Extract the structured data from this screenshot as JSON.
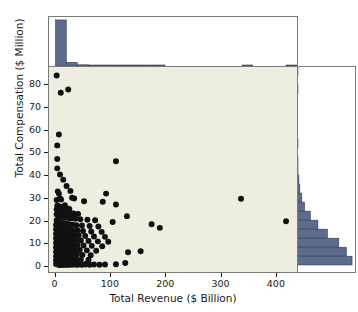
{
  "chart_data": {
    "type": "scatter",
    "title": "",
    "subtitle": "",
    "xlabel": "Total Revenue ($ Billion)",
    "ylabel": "Total Compensation ($ Million)",
    "xlim": [
      -12,
      440
    ],
    "ylim": [
      -3,
      88
    ],
    "xticks": [
      0,
      100,
      200,
      300,
      400
    ],
    "yticks": [
      0,
      10,
      20,
      30,
      40,
      50,
      60,
      70,
      80
    ],
    "grid": false,
    "legend": null,
    "marker": {
      "shape": "circle",
      "color": "#111111",
      "size": 3.0
    },
    "panel_background": "#eeeee0",
    "histogram_color": "#5d6c8c",
    "histogram_edge_color": "#2f3a52",
    "axis_color": "#7a7a7a",
    "points": [
      [
        2,
        84.2
      ],
      [
        9.5,
        76.6
      ],
      [
        23,
        78.0
      ],
      [
        6,
        58.0
      ],
      [
        3,
        53.2
      ],
      [
        3,
        47.2
      ],
      [
        3,
        43.0
      ],
      [
        110,
        46.2
      ],
      [
        8,
        40.3
      ],
      [
        14,
        38.0
      ],
      [
        20,
        35.2
      ],
      [
        27,
        33.0
      ],
      [
        4,
        32.8
      ],
      [
        6,
        31.8
      ],
      [
        92,
        31.8
      ],
      [
        30,
        30.0
      ],
      [
        34,
        29.6
      ],
      [
        338,
        29.5
      ],
      [
        8,
        29.6
      ],
      [
        10,
        29.2
      ],
      [
        2,
        29.0
      ],
      [
        52,
        28.4
      ],
      [
        86,
        28.2
      ],
      [
        110,
        27.0
      ],
      [
        17,
        26.6
      ],
      [
        3,
        26.4
      ],
      [
        5,
        26.2
      ],
      [
        9,
        26.0
      ],
      [
        12,
        25.8
      ],
      [
        16,
        25.4
      ],
      [
        21,
        25.2
      ],
      [
        25,
        25.0
      ],
      [
        2,
        24.8
      ],
      [
        4,
        24.6
      ],
      [
        6,
        24.4
      ],
      [
        8,
        24.2
      ],
      [
        11,
        24.0
      ],
      [
        14,
        23.8
      ],
      [
        18,
        23.6
      ],
      [
        22,
        23.4
      ],
      [
        27,
        23.2
      ],
      [
        33,
        23.0
      ],
      [
        41,
        22.8
      ],
      [
        2,
        22.6
      ],
      [
        3,
        22.4
      ],
      [
        5,
        22.2
      ],
      [
        7,
        22.0
      ],
      [
        9,
        21.8
      ],
      [
        12,
        21.6
      ],
      [
        15,
        21.4
      ],
      [
        19,
        21.2
      ],
      [
        24,
        21.0
      ],
      [
        29,
        20.8
      ],
      [
        36,
        20.6
      ],
      [
        45,
        20.4
      ],
      [
        58,
        20.2
      ],
      [
        72,
        20.0
      ],
      [
        130,
        21.8
      ],
      [
        104,
        19.2
      ],
      [
        2,
        20.0
      ],
      [
        3,
        19.8
      ],
      [
        4,
        19.6
      ],
      [
        6,
        19.4
      ],
      [
        8,
        19.2
      ],
      [
        10,
        19.0
      ],
      [
        13,
        18.8
      ],
      [
        16,
        18.6
      ],
      [
        20,
        18.4
      ],
      [
        25,
        18.2
      ],
      [
        31,
        18.0
      ],
      [
        38,
        17.8
      ],
      [
        48,
        17.6
      ],
      [
        62,
        17.4
      ],
      [
        78,
        17.2
      ],
      [
        190,
        16.6
      ],
      [
        175,
        18.2
      ],
      [
        420,
        19.5
      ],
      [
        1,
        18.0
      ],
      [
        2,
        17.8
      ],
      [
        3,
        17.6
      ],
      [
        4,
        17.4
      ],
      [
        6,
        17.2
      ],
      [
        7,
        17.0
      ],
      [
        9,
        16.8
      ],
      [
        11,
        16.6
      ],
      [
        14,
        16.4
      ],
      [
        17,
        16.2
      ],
      [
        21,
        16.0
      ],
      [
        26,
        15.8
      ],
      [
        32,
        15.6
      ],
      [
        40,
        15.4
      ],
      [
        50,
        15.2
      ],
      [
        65,
        15.0
      ],
      [
        84,
        14.8
      ],
      [
        1,
        16.0
      ],
      [
        2,
        15.8
      ],
      [
        3,
        15.6
      ],
      [
        4,
        15.4
      ],
      [
        5,
        15.2
      ],
      [
        7,
        15.0
      ],
      [
        8,
        14.8
      ],
      [
        10,
        14.6
      ],
      [
        12,
        14.4
      ],
      [
        15,
        14.2
      ],
      [
        18,
        14.0
      ],
      [
        22,
        13.8
      ],
      [
        27,
        13.6
      ],
      [
        34,
        13.4
      ],
      [
        42,
        13.2
      ],
      [
        54,
        13.0
      ],
      [
        70,
        12.8
      ],
      [
        90,
        12.6
      ],
      [
        1,
        14.0
      ],
      [
        2,
        13.8
      ],
      [
        3,
        13.6
      ],
      [
        4,
        13.4
      ],
      [
        5,
        13.2
      ],
      [
        6,
        13.0
      ],
      [
        8,
        12.8
      ],
      [
        9,
        12.6
      ],
      [
        11,
        12.4
      ],
      [
        13,
        12.2
      ],
      [
        16,
        12.0
      ],
      [
        20,
        11.8
      ],
      [
        24,
        11.6
      ],
      [
        30,
        11.4
      ],
      [
        37,
        11.2
      ],
      [
        46,
        11.0
      ],
      [
        60,
        10.8
      ],
      [
        77,
        10.6
      ],
      [
        96,
        10.4
      ],
      [
        1,
        12.0
      ],
      [
        2,
        11.8
      ],
      [
        3,
        11.6
      ],
      [
        4,
        11.4
      ],
      [
        5,
        11.2
      ],
      [
        6,
        11.0
      ],
      [
        7,
        10.8
      ],
      [
        9,
        10.6
      ],
      [
        10,
        10.4
      ],
      [
        12,
        10.2
      ],
      [
        14,
        10.0
      ],
      [
        17,
        9.8
      ],
      [
        21,
        9.6
      ],
      [
        26,
        9.4
      ],
      [
        32,
        9.2
      ],
      [
        40,
        9.0
      ],
      [
        51,
        8.8
      ],
      [
        66,
        8.6
      ],
      [
        85,
        8.4
      ],
      [
        1,
        10.0
      ],
      [
        2,
        9.8
      ],
      [
        3,
        9.6
      ],
      [
        4,
        9.4
      ],
      [
        5,
        9.2
      ],
      [
        6,
        9.0
      ],
      [
        7,
        8.8
      ],
      [
        8,
        8.6
      ],
      [
        10,
        8.4
      ],
      [
        11,
        8.2
      ],
      [
        13,
        8.0
      ],
      [
        15,
        7.8
      ],
      [
        18,
        7.6
      ],
      [
        22,
        7.4
      ],
      [
        28,
        7.2
      ],
      [
        35,
        7.0
      ],
      [
        44,
        6.8
      ],
      [
        57,
        6.6
      ],
      [
        74,
        6.4
      ],
      [
        1,
        8.0
      ],
      [
        2,
        7.8
      ],
      [
        3,
        7.6
      ],
      [
        4,
        7.4
      ],
      [
        5,
        7.2
      ],
      [
        6,
        7.0
      ],
      [
        7,
        6.8
      ],
      [
        8,
        6.6
      ],
      [
        9,
        6.4
      ],
      [
        11,
        6.2
      ],
      [
        12,
        6.0
      ],
      [
        14,
        5.8
      ],
      [
        17,
        5.6
      ],
      [
        20,
        5.4
      ],
      [
        25,
        5.2
      ],
      [
        31,
        5.0
      ],
      [
        39,
        4.8
      ],
      [
        49,
        4.6
      ],
      [
        64,
        4.4
      ],
      [
        155,
        6.2
      ],
      [
        132,
        5.8
      ],
      [
        1,
        6.0
      ],
      [
        2,
        5.8
      ],
      [
        3,
        5.6
      ],
      [
        4,
        5.4
      ],
      [
        5,
        5.2
      ],
      [
        6,
        5.0
      ],
      [
        7,
        4.8
      ],
      [
        8,
        4.6
      ],
      [
        9,
        4.4
      ],
      [
        10,
        4.2
      ],
      [
        12,
        4.0
      ],
      [
        13,
        3.8
      ],
      [
        16,
        3.6
      ],
      [
        19,
        3.4
      ],
      [
        23,
        3.2
      ],
      [
        29,
        3.0
      ],
      [
        36,
        2.8
      ],
      [
        46,
        2.6
      ],
      [
        60,
        2.4
      ],
      [
        1,
        4.0
      ],
      [
        2,
        3.8
      ],
      [
        3,
        3.6
      ],
      [
        4,
        3.4
      ],
      [
        5,
        3.2
      ],
      [
        6,
        3.0
      ],
      [
        7,
        2.8
      ],
      [
        8,
        2.6
      ],
      [
        9,
        2.4
      ],
      [
        10,
        2.2
      ],
      [
        11,
        2.0
      ],
      [
        13,
        1.8
      ],
      [
        15,
        1.6
      ],
      [
        18,
        1.4
      ],
      [
        22,
        1.2
      ],
      [
        27,
        1.0
      ],
      [
        34,
        0.9
      ],
      [
        43,
        0.8
      ],
      [
        56,
        0.7
      ],
      [
        1,
        2.2
      ],
      [
        2,
        2.0
      ],
      [
        3,
        1.8
      ],
      [
        4,
        1.6
      ],
      [
        5,
        1.4
      ],
      [
        6,
        1.2
      ],
      [
        7,
        1.0
      ],
      [
        8,
        0.9
      ],
      [
        9,
        0.8
      ],
      [
        10,
        0.7
      ],
      [
        12,
        0.6
      ],
      [
        14,
        0.5
      ],
      [
        17,
        0.5
      ],
      [
        21,
        0.4
      ],
      [
        26,
        0.4
      ],
      [
        33,
        0.4
      ],
      [
        42,
        0.3
      ],
      [
        54,
        0.3
      ],
      [
        70,
        0.3
      ],
      [
        90,
        0.3
      ],
      [
        110,
        0.4
      ],
      [
        127,
        1.0
      ],
      [
        1,
        0.6
      ],
      [
        2,
        0.5
      ],
      [
        3,
        0.4
      ],
      [
        4,
        0.4
      ],
      [
        5,
        0.3
      ],
      [
        6,
        0.3
      ],
      [
        7,
        0.3
      ],
      [
        8,
        0.2
      ],
      [
        9,
        0.2
      ],
      [
        11,
        0.2
      ],
      [
        13,
        0.2
      ],
      [
        16,
        0.2
      ],
      [
        20,
        0.2
      ],
      [
        24,
        0.2
      ],
      [
        30,
        0.2
      ],
      [
        38,
        0.2
      ],
      [
        48,
        0.2
      ],
      [
        62,
        0.2
      ],
      [
        80,
        0.2
      ]
    ]
  },
  "top_histogram": {
    "orientation": "vertical",
    "bin_width": 20,
    "bin_starts": [
      0,
      20,
      40,
      60,
      80,
      100,
      120,
      140,
      160,
      180,
      200,
      220,
      240,
      260,
      280,
      300,
      320,
      340,
      360,
      380,
      400,
      420
    ],
    "counts": [
      232,
      18,
      6,
      4,
      3,
      3,
      2,
      2,
      1,
      1,
      0,
      0,
      0,
      0,
      0,
      0,
      0,
      1,
      0,
      0,
      0,
      1
    ],
    "max_count": 232
  },
  "right_histogram": {
    "orientation": "horizontal",
    "bin_width": 4,
    "bin_starts": [
      0,
      4,
      8,
      12,
      16,
      20,
      24,
      28,
      32,
      36,
      40,
      44,
      48,
      52,
      56,
      60,
      64,
      68,
      72,
      76,
      80,
      84
    ],
    "counts": [
      58,
      52,
      44,
      32,
      22,
      14,
      8,
      5,
      3,
      2,
      1,
      1,
      0,
      1,
      0,
      0,
      0,
      0,
      0,
      1,
      0,
      1
    ],
    "max_count": 58
  },
  "axes": {
    "x_title": "Total Revenue ($ Billion)",
    "y_title": "Total Compensation ($ Million)",
    "x_tick_labels": [
      "0",
      "100",
      "200",
      "300",
      "400"
    ],
    "y_tick_labels": [
      "0",
      "10",
      "20",
      "30",
      "40",
      "50",
      "60",
      "70",
      "80"
    ]
  }
}
